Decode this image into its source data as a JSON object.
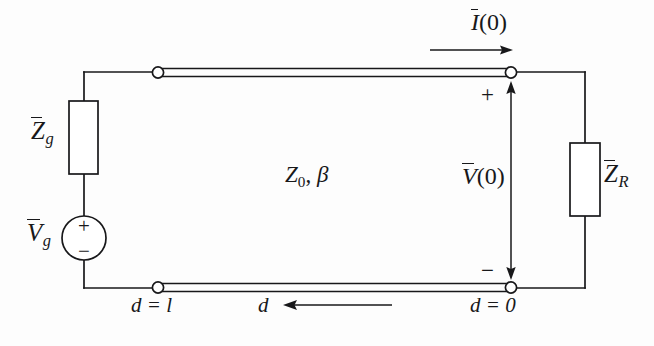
{
  "figure": {
    "background_color": "#fdfdfd",
    "ink_color": "#18181a"
  },
  "labels": {
    "generator_impedance": {
      "symbol": "Z",
      "subscript": "g",
      "overbar": true,
      "text": "Z̄g"
    },
    "generator_voltage": {
      "symbol": "V",
      "subscript": "g",
      "overbar": true,
      "text": "V̄g"
    },
    "load_impedance": {
      "symbol": "Z",
      "subscript": "R",
      "overbar": true,
      "text": "Z̄R"
    },
    "line_parameters": {
      "symbol": "Z",
      "subscript": "0",
      "second": "β",
      "text": "Z₀, β"
    },
    "terminal_current": {
      "symbol": "I",
      "overbar": true,
      "argument": "(0)",
      "text": "Ī(0)"
    },
    "terminal_voltage": {
      "symbol": "V",
      "overbar": true,
      "argument": "(0)",
      "text": "V̄(0)"
    },
    "polarity_plus_terminal": "+",
    "polarity_minus_terminal": "−",
    "source_plus": "+",
    "source_minus": "−",
    "distance_at_generator": "d = l",
    "distance_symbol": "d",
    "distance_at_load": "d = 0"
  },
  "components": {
    "generator_impedance_box": {
      "x": 69,
      "y": 101,
      "width": 29,
      "height": 73
    },
    "load_impedance_box": {
      "x": 570,
      "y": 143,
      "width": 30,
      "height": 73
    },
    "voltage_source_circle": {
      "cx": 84,
      "cy": 238,
      "r": 22
    },
    "terminals": [
      {
        "name": "top-left-terminal",
        "cx": 158,
        "cy": 73,
        "r": 5.5
      },
      {
        "name": "top-right-terminal",
        "cx": 511,
        "cy": 72,
        "r": 5.5
      },
      {
        "name": "bottom-left-terminal",
        "cx": 158,
        "cy": 288,
        "r": 5.5
      },
      {
        "name": "bottom-right-terminal",
        "cx": 511,
        "cy": 288,
        "r": 5.5
      }
    ],
    "transmission_line_top": {
      "x1": 160,
      "x2": 511,
      "y": 69,
      "thickness": 7
    },
    "transmission_line_bottom": {
      "x1": 160,
      "x2": 511,
      "y": 285,
      "thickness": 7
    }
  },
  "arrows": {
    "current_arrow": {
      "x1": 430,
      "x2": 512,
      "y": 50,
      "direction": "right"
    },
    "voltage_arrow": {
      "x": 511,
      "y1": 86,
      "y2": 275,
      "direction": "both"
    },
    "distance_arrow": {
      "x1": 392,
      "x2": 285,
      "y": 288,
      "direction": "left"
    }
  }
}
